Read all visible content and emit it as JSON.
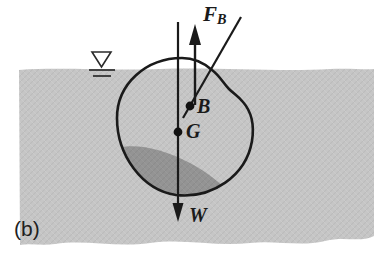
{
  "figure": {
    "panel_label": "(b)",
    "labels": {
      "buoyant_force": {
        "symbol": "F",
        "subscript": "B",
        "text": "F_B"
      },
      "center_of_buoyancy": "B",
      "center_of_gravity": "G",
      "weight": "W"
    },
    "icons": {
      "water_surface_symbol": "water-level-triangle-icon",
      "buoyant_force_arrow": "up-arrow-icon",
      "weight_arrow": "down-arrow-icon"
    },
    "colors": {
      "water_fill": "#c6c6c6",
      "submerged_shade": "#949494",
      "outline": "#1a1a1a",
      "background": "#ffffff",
      "label_text": "#1a1a1a"
    },
    "geometry": {
      "water_top_y": 69,
      "water_bottom_y": 245,
      "water_left_x": 18,
      "water_right_x": 374,
      "body_center": [
        182,
        132
      ],
      "point_B": [
        190,
        106
      ],
      "point_G": [
        178,
        132
      ],
      "weight_arrow_tip": [
        178,
        221
      ],
      "buoyant_arrow_tip": [
        195,
        24
      ]
    }
  }
}
